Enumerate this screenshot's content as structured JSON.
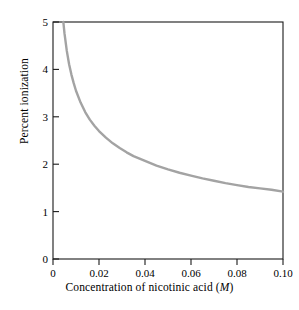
{
  "chart_data": {
    "type": "line",
    "title": "",
    "xlabel_text": "Concentration of nicotinic acid (",
    "xlabel_symbol": "M",
    "xlabel_tail": ")",
    "xlabel": "Concentration of nicotinic acid (M)",
    "ylabel": "Percent ionization",
    "xlim": [
      0,
      0.1
    ],
    "ylim": [
      0,
      5
    ],
    "xticks": [
      "0",
      "0.02",
      "0.04",
      "0.06",
      "0.08",
      "0.10"
    ],
    "xtick_values": [
      0,
      0.02,
      0.04,
      0.06,
      0.08,
      0.1
    ],
    "yticks": [
      "0",
      "1",
      "2",
      "3",
      "4",
      "5"
    ],
    "ytick_values": [
      0,
      1,
      2,
      3,
      4,
      5
    ],
    "grid": false,
    "legend": "none",
    "series": [
      {
        "name": "Percent ionization of nicotinic acid",
        "color": "#a3a3a3",
        "linewidth": 2.4,
        "x": [
          0.0045,
          0.005,
          0.006,
          0.007,
          0.008,
          0.009,
          0.01,
          0.012,
          0.014,
          0.016,
          0.018,
          0.02,
          0.023,
          0.026,
          0.029,
          0.032,
          0.035,
          0.04,
          0.045,
          0.05,
          0.055,
          0.06,
          0.065,
          0.07,
          0.075,
          0.08,
          0.085,
          0.09,
          0.095,
          0.1
        ],
        "y": [
          5.0,
          4.76,
          4.39,
          4.11,
          3.89,
          3.71,
          3.55,
          3.3,
          3.1,
          2.94,
          2.81,
          2.7,
          2.56,
          2.44,
          2.34,
          2.25,
          2.17,
          2.07,
          1.97,
          1.89,
          1.82,
          1.76,
          1.7,
          1.65,
          1.6,
          1.56,
          1.52,
          1.49,
          1.46,
          1.42
        ]
      }
    ],
    "axis_color": "#1a1a1a",
    "background": "#ffffff",
    "frame": "full-box",
    "plot_area": {
      "left": 53,
      "right": 283,
      "top": 22,
      "bottom": 259
    }
  }
}
